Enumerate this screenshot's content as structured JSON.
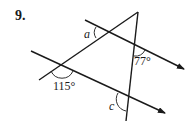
{
  "problem": {
    "number": "9."
  },
  "diagram": {
    "labels": {
      "angle_a": "a",
      "angle_77": "77°",
      "angle_115": "115°",
      "angle_c": "c"
    },
    "colors": {
      "stroke": "#1a1a1a",
      "background": "#ffffff"
    }
  }
}
